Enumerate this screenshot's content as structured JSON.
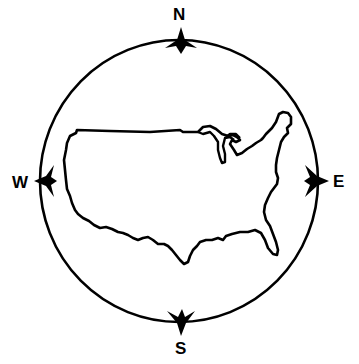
{
  "figure": {
    "colors": {
      "ink": "#000000",
      "background": "#ffffff"
    },
    "directions": {
      "north": "N",
      "south": "S",
      "east": "E",
      "west": "W"
    },
    "map_region": "contiguous-united-states"
  }
}
